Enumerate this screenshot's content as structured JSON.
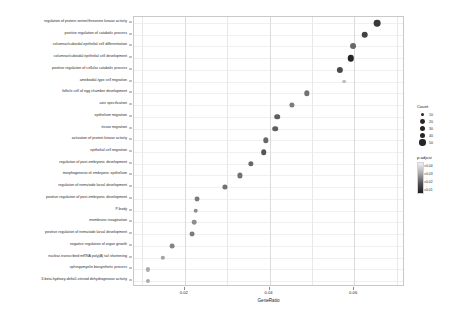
{
  "chart_data": {
    "type": "scatter",
    "title": "",
    "xlabel": "GeneRatio",
    "ylabel": "",
    "xlim": [
      0.008,
      0.072
    ],
    "xticks": [
      0.02,
      0.04,
      0.06
    ],
    "xtick_labels": [
      "0.02",
      "0.04",
      "0.06"
    ],
    "grid": true,
    "legend_position": "right",
    "categories": [
      "regulation of protein serine/threonine kinase activity",
      "positive regulation of catabolic process",
      "columnar/cuboidal epithelial cell differentiation",
      "columnar/cuboidal epithelial cell development",
      "positive regulation of cellular catabolic process",
      "ameboidal-type cell migration",
      "follicle cell of egg chamber development",
      "axis specification",
      "epithelium migration",
      "tissue migration",
      "activation of protein kinase activity",
      "epithelial cell migration",
      "regulation of post-embryonic development",
      "morphogenesis of embryonic epithelium",
      "regulation of nematode larval development",
      "positive regulation of post-embryonic development",
      "P-body",
      "membrane invagination",
      "positive regulation of nematode larval development",
      "negative regulation of organ growth",
      "nuclear-transcribed mRNA poly(A) tail shortening",
      "sphingomyelin biosynthetic process",
      "3-beta-hydroxy-delta5-steroid dehydrogenase activity"
    ],
    "points": [
      {
        "term": "regulation of protein serine/threonine kinase activity",
        "gene_ratio": 0.0655,
        "count": 60,
        "p_adjust": 0.04
      },
      {
        "term": "positive regulation of catabolic process",
        "gene_ratio": 0.0625,
        "count": 56,
        "p_adjust": 0.038
      },
      {
        "term": "columnar/cuboidal epithelial cell differentiation",
        "gene_ratio": 0.0598,
        "count": 40,
        "p_adjust": 0.03
      },
      {
        "term": "columnar/cuboidal epithelial cell development",
        "gene_ratio": 0.0592,
        "count": 52,
        "p_adjust": 0.044
      },
      {
        "term": "positive regulation of cellular catabolic process",
        "gene_ratio": 0.0566,
        "count": 48,
        "p_adjust": 0.036
      },
      {
        "term": "ameboidal-type cell migration",
        "gene_ratio": 0.0576,
        "count": 8,
        "p_adjust": 0.012
      },
      {
        "term": "follicle cell of egg chamber development",
        "gene_ratio": 0.0488,
        "count": 30,
        "p_adjust": 0.028
      },
      {
        "term": "axis specification",
        "gene_ratio": 0.0452,
        "count": 26,
        "p_adjust": 0.026
      },
      {
        "term": "epithelium migration",
        "gene_ratio": 0.0418,
        "count": 34,
        "p_adjust": 0.032
      },
      {
        "term": "tissue migration",
        "gene_ratio": 0.0414,
        "count": 34,
        "p_adjust": 0.032
      },
      {
        "term": "activation of protein kinase activity",
        "gene_ratio": 0.0392,
        "count": 30,
        "p_adjust": 0.03
      },
      {
        "term": "epithelial cell migration",
        "gene_ratio": 0.0386,
        "count": 34,
        "p_adjust": 0.034
      },
      {
        "term": "regulation of post-embryonic development",
        "gene_ratio": 0.0356,
        "count": 28,
        "p_adjust": 0.03
      },
      {
        "term": "morphogenesis of embryonic epithelium",
        "gene_ratio": 0.033,
        "count": 26,
        "p_adjust": 0.028
      },
      {
        "term": "regulation of nematode larval development",
        "gene_ratio": 0.0294,
        "count": 26,
        "p_adjust": 0.028
      },
      {
        "term": "positive regulation of post-embryonic development",
        "gene_ratio": 0.0228,
        "count": 22,
        "p_adjust": 0.026
      },
      {
        "term": "P-body",
        "gene_ratio": 0.0226,
        "count": 18,
        "p_adjust": 0.022
      },
      {
        "term": "membrane invagination",
        "gene_ratio": 0.0222,
        "count": 18,
        "p_adjust": 0.022
      },
      {
        "term": "positive regulation of nematode larval development",
        "gene_ratio": 0.0218,
        "count": 22,
        "p_adjust": 0.026
      },
      {
        "term": "negative regulation of organ growth",
        "gene_ratio": 0.017,
        "count": 20,
        "p_adjust": 0.024
      },
      {
        "term": "nuclear-transcribed mRNA poly(A) tail shortening",
        "gene_ratio": 0.0148,
        "count": 14,
        "p_adjust": 0.018
      },
      {
        "term": "sphingomyelin biosynthetic process",
        "gene_ratio": 0.0112,
        "count": 12,
        "p_adjust": 0.016
      },
      {
        "term": "3-beta-hydroxy-delta5-steroid dehydrogenase activity",
        "gene_ratio": 0.0112,
        "count": 12,
        "p_adjust": 0.016
      }
    ],
    "legends": {
      "size": {
        "title": "Count",
        "entries": [
          {
            "label": "10",
            "count": 10
          },
          {
            "label": "20",
            "count": 20
          },
          {
            "label": "30",
            "count": 30
          },
          {
            "label": "40",
            "count": 40
          },
          {
            "label": "50",
            "count": 50
          }
        ]
      },
      "color": {
        "title": "p.adjust",
        "ticks": [
          "0.04",
          "0.03",
          "0.02",
          "0.01"
        ],
        "low_color": "#1c1c1c",
        "high_color": "#f2f2f2"
      }
    }
  }
}
